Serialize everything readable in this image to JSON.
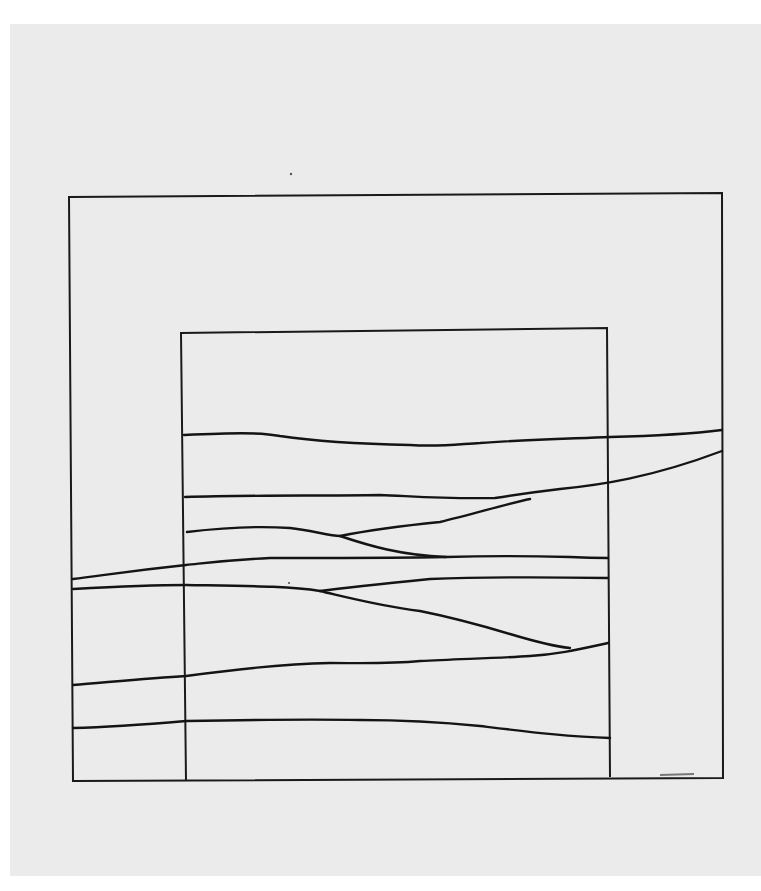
{
  "artwork": {
    "background": "#ebebeb",
    "ink": "#141414",
    "outer_frame": "M69,197 L722,193 L723,778 L73,781 Z",
    "inner_frame": "M186,781 L181,333 L607,328 L610,777",
    "strands": [
      "M184,435 C230,433 260,432 280,436 C320,442 360,444 410,445 C440,447 460,444 480,443 C520,440 560,439 610,437 C650,436 690,434 722,430",
      "M185,497 C250,495 320,496 380,495 C410,496 440,499 495,498 C520,494 535,492 560,489 C600,485 650,478 722,451",
      "M187,532 C220,528 260,526 290,528 C310,530 330,536 340,536 C360,532 390,527 440,522 C470,515 510,503 530,499",
      "M340,536 C370,546 400,555 446,557",
      "M73,579 C100,576 120,572 186,565 C215,562 230,560 270,558 C320,558 400,558 446,557 C480,556 530,556 570,557 C590,558 600,558 608,558",
      "M73,589 C110,587 150,585 186,585 C250,586 290,586 320,591 C350,598 380,606 420,611 C450,617 480,625 510,634 C530,640 550,646 570,648",
      "M320,591 C350,587 390,583 430,579 C480,577 540,577 608,578",
      "M73,685 C110,682 150,678 186,676 C230,670 280,664 330,663 C360,663 390,664 420,661 C460,659 500,658 530,656 C560,654 580,649 608,643",
      "M73,728 C110,727 150,724 186,721 C240,720 300,719 360,720 C400,720 440,722 480,726 C530,732 570,737 610,738"
    ],
    "bottom_smudge": "M660,775 L694,774",
    "specks": [
      {
        "cx": 291,
        "cy": 174,
        "r": 1.2
      },
      {
        "cx": 289,
        "cy": 583,
        "r": 1.1
      }
    ]
  }
}
